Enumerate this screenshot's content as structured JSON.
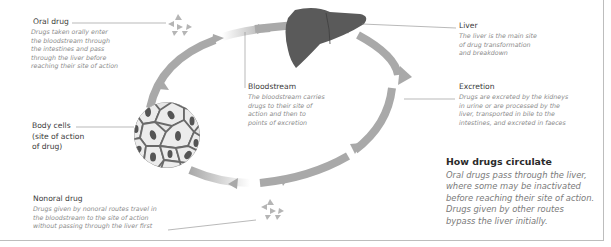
{
  "diagram": {
    "title": "How drugs circulate",
    "summary_lines": [
      "Oral drugs pass through the liver,",
      "where some may be inactivated",
      "before reaching their site of action.",
      "Drugs given by other routes",
      "bypass the liver initially."
    ],
    "nodes": {
      "oral_drug": {
        "label": "Oral drug",
        "desc": [
          "Drugs taken orally enter",
          "the bloodstream through",
          "the intestines and pass",
          "through the liver before",
          "reaching their site of action"
        ]
      },
      "liver": {
        "label": "Liver",
        "desc": [
          "The liver is the main site",
          "of drug transformation",
          "and breakdown"
        ]
      },
      "bloodstream": {
        "label": "Bloodstream",
        "desc": [
          "The bloodstream carries",
          "drugs to their site of",
          "action and then to",
          "points of excretion"
        ]
      },
      "excretion": {
        "label": "Excretion",
        "desc": [
          "Drugs are excreted by the kidneys",
          "in urine or are processed by the",
          "liver, transported in bile to the",
          "intestines, and excreted in faeces"
        ]
      },
      "body_cells": {
        "label": [
          "Body cells",
          "(site of action",
          "of drug)"
        ]
      },
      "nonoral_drug": {
        "label": "Nonoral drug",
        "desc": [
          "Drugs given by nonoral routes travel in",
          "the bloodstream to the site of action",
          "without passing through the liver first"
        ]
      }
    },
    "icons": [
      "pill-particles-icon-oral",
      "liver-icon",
      "body-cells-icon",
      "pill-particles-icon-nonoral",
      "circulation-arrows"
    ],
    "colors": {
      "arrow": "#a9a9a9",
      "liver": "#5a5a5a",
      "cell_fill": "#e6e6e6",
      "cell_nucleus": "#5a5a5a",
      "label_text": "#3a3a3a",
      "desc_text": "#8a8a8a"
    }
  }
}
